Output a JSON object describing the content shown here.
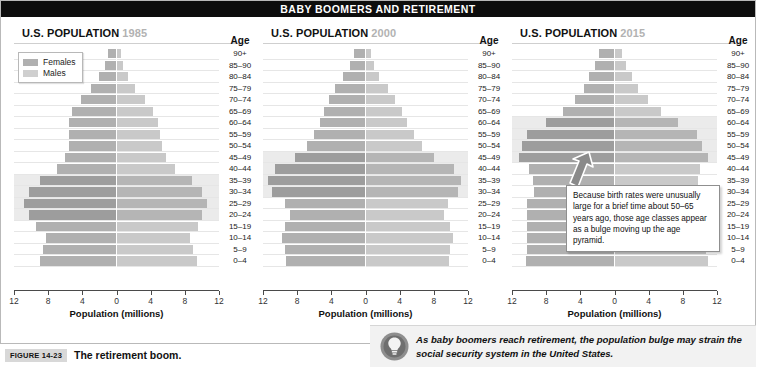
{
  "banner": {
    "title": "BABY BOOMERS AND RETIREMENT"
  },
  "legend": {
    "females_label": "Females",
    "males_label": "Males",
    "female_color": "#b0b0b0",
    "male_color": "#cfcfcf"
  },
  "axis": {
    "age_header": "Age",
    "x_title": "Population (millions)",
    "x_ticks": [
      "12",
      "8",
      "4",
      "0",
      "4",
      "8",
      "12"
    ],
    "age_groups": [
      "90+",
      "85–90",
      "80–84",
      "75–79",
      "70–74",
      "65–69",
      "60–64",
      "55–59",
      "50–54",
      "45–49",
      "40–44",
      "35–39",
      "30–34",
      "25–29",
      "20–24",
      "15–19",
      "10–14",
      "5–9",
      "0–4"
    ]
  },
  "panels": [
    {
      "title": "U.S. POPULATION",
      "year": "1985"
    },
    {
      "title": "U.S. POPULATION",
      "year": "2000"
    },
    {
      "title": "U.S. POPULATION",
      "year": "2015"
    }
  ],
  "callout": {
    "text": "Because birth rates were unusually large for a brief time about 50–65 years ago, those age classes appear as a bulge moving up the age pyramid."
  },
  "note": {
    "icon": "lightbulb-icon",
    "text": "As baby boomers reach retirement, the population bulge may strain the social security system in the United States."
  },
  "caption": {
    "tag": "FIGURE 14-23",
    "title": "The retirement boom."
  },
  "chart_data": {
    "type": "bar",
    "title": "BABY BOOMERS AND RETIREMENT",
    "subtitle": "U.S. population age pyramids for 1985, 2000 and 2015",
    "xlabel": "Population (millions)",
    "ylabel": "Age",
    "xlim": [
      -12,
      12
    ],
    "xticks": [
      12,
      8,
      4,
      0,
      4,
      8,
      12
    ],
    "grid": true,
    "legend_position": "top-left",
    "orientation": "horizontal-diverging",
    "categories": [
      "90+",
      "85–90",
      "80–84",
      "75–79",
      "70–74",
      "65–69",
      "60–64",
      "55–59",
      "50–54",
      "45–49",
      "40–44",
      "35–39",
      "30–34",
      "25–29",
      "20–24",
      "15–19",
      "10–14",
      "5–9",
      "0–4"
    ],
    "charts": [
      {
        "year": "1985",
        "bulge_groups": [
          "35–39",
          "30–34",
          "25–29",
          "20–24"
        ],
        "series": [
          {
            "name": "Females",
            "side": "left",
            "values": [
              1.0,
              1.3,
              2.0,
              3.0,
              4.2,
              5.2,
              5.6,
              5.6,
              5.6,
              6.0,
              7.0,
              9.0,
              10.2,
              10.8,
              10.2,
              9.4,
              8.3,
              8.6,
              9.0
            ]
          },
          {
            "name": "Males",
            "side": "right",
            "values": [
              0.5,
              0.8,
              1.3,
              2.2,
              3.3,
              4.3,
              4.9,
              5.1,
              5.3,
              5.8,
              6.8,
              8.8,
              10.0,
              10.6,
              10.0,
              9.5,
              8.6,
              9.0,
              9.4
            ]
          }
        ]
      },
      {
        "year": "2000",
        "bulge_groups": [
          "45–49",
          "40–44",
          "35–39",
          "30–34"
        ],
        "series": [
          {
            "name": "Females",
            "side": "left",
            "values": [
              1.3,
              1.8,
              2.6,
              3.6,
              4.3,
              4.9,
              5.3,
              6.0,
              6.8,
              8.2,
              10.6,
              11.4,
              11.0,
              9.4,
              8.8,
              9.4,
              9.8,
              9.4,
              9.3
            ]
          },
          {
            "name": "Males",
            "side": "right",
            "values": [
              0.6,
              1.0,
              1.6,
              2.6,
              3.5,
              4.3,
              4.9,
              5.7,
              6.6,
              8.0,
              10.4,
              11.2,
              10.8,
              9.6,
              9.2,
              9.9,
              10.3,
              9.9,
              9.8
            ]
          }
        ]
      },
      {
        "year": "2015",
        "bulge_groups": [
          "60–64",
          "55–59",
          "50–54",
          "45–49"
        ],
        "series": [
          {
            "name": "Females",
            "side": "left",
            "values": [
              1.8,
              2.3,
              3.0,
              3.6,
              4.6,
              6.0,
              8.0,
              10.2,
              10.8,
              11.2,
              10.0,
              9.6,
              9.4,
              10.2,
              10.2,
              10.2,
              10.2,
              10.2,
              10.4
            ]
          },
          {
            "name": "Males",
            "side": "right",
            "values": [
              0.9,
              1.3,
              2.0,
              2.8,
              3.9,
              5.4,
              7.4,
              9.6,
              10.3,
              10.9,
              10.0,
              9.8,
              9.7,
              10.6,
              10.6,
              10.6,
              10.7,
              10.7,
              11.0
            ]
          }
        ]
      }
    ]
  }
}
